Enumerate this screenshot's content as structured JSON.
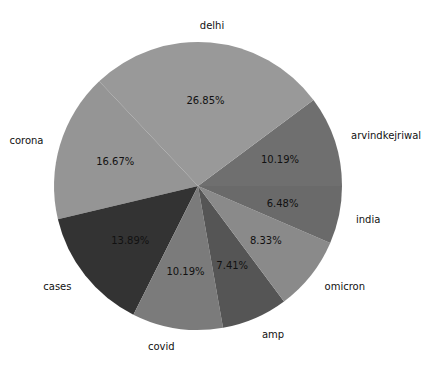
{
  "chart_data": {
    "type": "pie",
    "title": "",
    "start_angle_deg": 0,
    "direction": "counterclockwise",
    "categories": [
      "arvindkejriwal",
      "delhi",
      "corona",
      "cases",
      "covid",
      "amp",
      "omicron",
      "india"
    ],
    "values": [
      10.19,
      26.85,
      16.67,
      13.89,
      10.19,
      7.41,
      8.33,
      6.48
    ],
    "labels_pct": [
      "10.19%",
      "26.85%",
      "16.67%",
      "13.89%",
      "10.19%",
      "7.41%",
      "8.33%",
      "6.48%"
    ],
    "colors": [
      "#6f6f6f",
      "#999999",
      "#959595",
      "#333333",
      "#7b7b7b",
      "#555555",
      "#8a8a8a",
      "#6a6a6a"
    ],
    "legend": "none"
  }
}
